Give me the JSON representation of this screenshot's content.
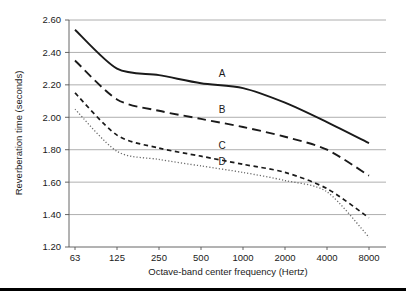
{
  "chart_data": {
    "type": "line",
    "title": "",
    "xlabel": "Octave-band center frequency (Hertz)",
    "ylabel": "Reverberation time (seconds)",
    "x": [
      63,
      125,
      250,
      500,
      1000,
      2000,
      4000,
      8000
    ],
    "xtick_labels": [
      "63",
      "125",
      "250",
      "500",
      "1000",
      "2000",
      "4000",
      "8000"
    ],
    "xscale": "log-octave",
    "ytick_labels": [
      "1.20",
      "1.40",
      "1.60",
      "1.80",
      "2.00",
      "2.20",
      "2.40",
      "2.60"
    ],
    "yticks": [
      1.2,
      1.4,
      1.6,
      1.8,
      2.0,
      2.2,
      2.4,
      2.6
    ],
    "ylim": [
      1.2,
      2.6
    ],
    "grid": "horizontal",
    "legend": "inline-labels",
    "series": [
      {
        "name": "A",
        "label": "A",
        "style": "solid",
        "color": "#1a1a1a",
        "values": [
          2.54,
          2.3,
          2.26,
          2.21,
          2.18,
          2.09,
          1.97,
          1.84
        ]
      },
      {
        "name": "B",
        "label": "B",
        "style": "dashed",
        "color": "#1a1a1a",
        "values": [
          2.35,
          2.11,
          2.04,
          1.99,
          1.94,
          1.88,
          1.8,
          1.64
        ]
      },
      {
        "name": "C",
        "label": "C",
        "style": "short-dashed",
        "color": "#1a1a1a",
        "values": [
          2.15,
          1.89,
          1.81,
          1.76,
          1.71,
          1.66,
          1.56,
          1.38
        ]
      },
      {
        "name": "D",
        "label": "D",
        "style": "dotted",
        "color": "#6b6b6b",
        "values": [
          2.05,
          1.79,
          1.74,
          1.7,
          1.66,
          1.61,
          1.54,
          1.26
        ]
      }
    ],
    "label_positions": [
      {
        "name": "A",
        "x": 500,
        "y": 2.21
      },
      {
        "name": "B",
        "x": 500,
        "y": 1.99
      },
      {
        "name": "C",
        "x": 500,
        "y": 1.77
      },
      {
        "name": "D",
        "x": 500,
        "y": 1.67
      }
    ]
  }
}
